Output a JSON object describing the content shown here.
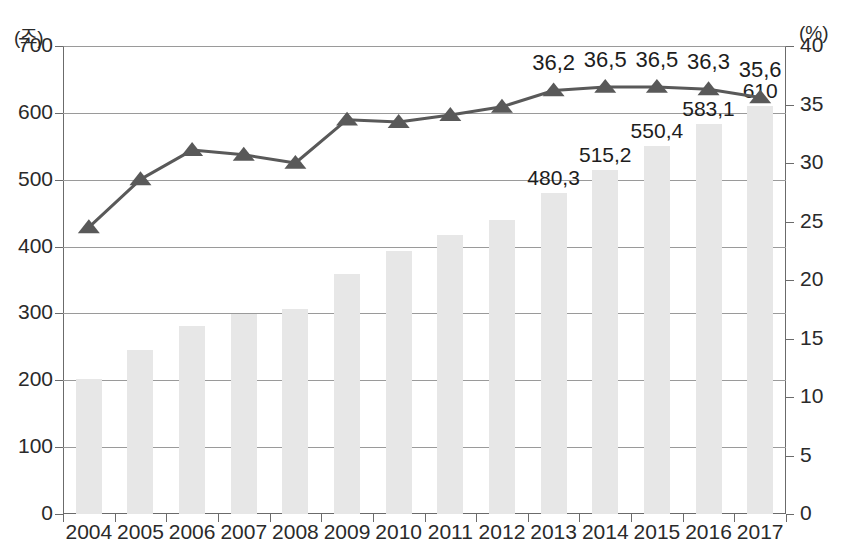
{
  "chart_data": {
    "type": "bar",
    "title": "",
    "subtitle": "",
    "xlabel": "",
    "ylabel": "(조)",
    "y2label": "(%)",
    "grid": true,
    "legend": "none",
    "categories": [
      "2004",
      "2005",
      "2006",
      "2007",
      "2008",
      "2009",
      "2010",
      "2011",
      "2012",
      "2013",
      "2014",
      "2015",
      "2016",
      "2017"
    ],
    "ylim": [
      0,
      700
    ],
    "yticks": [
      "0",
      "100",
      "200",
      "300",
      "400",
      "500",
      "600",
      "700"
    ],
    "y2lim": [
      0,
      40
    ],
    "y2ticks": [
      "0",
      "5",
      "10",
      "15",
      "20",
      "25",
      "30",
      "35",
      "40"
    ],
    "series": [
      {
        "name": "조",
        "type": "bar",
        "axis": "left",
        "color": "#e7e7e7",
        "values": [
          202,
          246,
          281,
          299,
          306,
          359,
          393,
          418,
          440,
          480.3,
          515.2,
          550.4,
          583.1,
          610
        ],
        "labels": [
          "",
          "",
          "",
          "",
          "",
          "",
          "",
          "",
          "",
          "480,3",
          "515,2",
          "550,4",
          "583,1",
          "610"
        ]
      },
      {
        "name": "%",
        "type": "line",
        "axis": "right",
        "color": "#595959",
        "marker": "triangle",
        "values": [
          24.5,
          28.6,
          31.1,
          30.7,
          30.0,
          33.7,
          33.5,
          34.1,
          34.8,
          36.2,
          36.5,
          36.5,
          36.3,
          35.6
        ],
        "labels": [
          "",
          "",
          "",
          "",
          "",
          "",
          "",
          "",
          "",
          "36,2",
          "36,5",
          "36,5",
          "36,3",
          "35,6"
        ]
      }
    ]
  }
}
